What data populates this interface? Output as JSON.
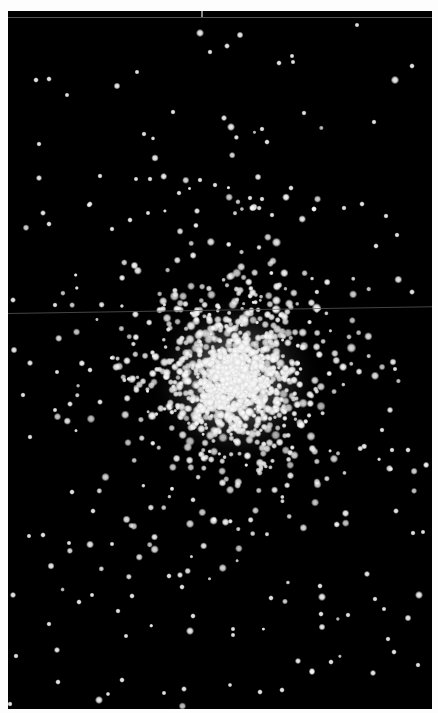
{
  "image": {
    "subject": "globular star cluster",
    "width": 438,
    "height": 713,
    "border_color": "#fdfdfd",
    "background_color": "#000000",
    "frame": {
      "left": 8,
      "top": 11,
      "width": 424,
      "height": 698
    }
  },
  "artifacts": {
    "top_seam": {
      "y": 17,
      "color": "#7a7a7a"
    },
    "mid_seam": {
      "y_left": 315,
      "y_right": 307,
      "color": "#5a5a5a"
    },
    "top_tick": {
      "x": 201,
      "y": 11
    }
  },
  "cluster": {
    "center": [
      235,
      380
    ],
    "core_radius": 55,
    "halo_radius": 190,
    "core_glow_color": "#ffffff",
    "star_color": "#f2f2f2",
    "core_star_count": 900,
    "halo_star_count": 650,
    "seed": 1337
  },
  "field_stars": [
    [
      200,
      33,
      2.6
    ],
    [
      240,
      35,
      2.2
    ],
    [
      227,
      46,
      1.9
    ],
    [
      210,
      52,
      1.7
    ],
    [
      357,
      25,
      1.6
    ],
    [
      49,
      79,
      1.8
    ],
    [
      36,
      80,
      1.8
    ],
    [
      117,
      86,
      2.2
    ],
    [
      137,
      72,
      1.6
    ],
    [
      279,
      63,
      1.8
    ],
    [
      292,
      56,
      1.6
    ],
    [
      293,
      62,
      1.6
    ],
    [
      395,
      80,
      2.7
    ],
    [
      412,
      66,
      1.8
    ],
    [
      67,
      95,
      1.6
    ],
    [
      173,
      112,
      1.7
    ],
    [
      231,
      127,
      2.6
    ],
    [
      224,
      118,
      2.0
    ],
    [
      262,
      129,
      1.7
    ],
    [
      267,
      142,
      1.8
    ],
    [
      304,
      113,
      1.7
    ],
    [
      39,
      144,
      1.7
    ],
    [
      144,
      134,
      1.7
    ],
    [
      155,
      158,
      2.4
    ],
    [
      374,
      122,
      1.7
    ],
    [
      39,
      178,
      2.0
    ],
    [
      100,
      176,
      1.7
    ],
    [
      136,
      179,
      1.6
    ],
    [
      150,
      179,
      1.7
    ],
    [
      200,
      180,
      1.7
    ],
    [
      215,
      185,
      1.7
    ],
    [
      258,
      177,
      2.2
    ],
    [
      291,
      188,
      1.8
    ],
    [
      179,
      193,
      1.7
    ],
    [
      90,
      204,
      1.8
    ],
    [
      250,
      198,
      1.7
    ],
    [
      262,
      199,
      1.7
    ],
    [
      253,
      208,
      2.2
    ],
    [
      314,
      209,
      1.8
    ],
    [
      344,
      208,
      1.7
    ],
    [
      362,
      204,
      1.8
    ],
    [
      43,
      213,
      1.9
    ],
    [
      49,
      224,
      1.8
    ],
    [
      89,
      205,
      1.7
    ],
    [
      148,
      213,
      1.6
    ],
    [
      197,
      211,
      2.0
    ],
    [
      252,
      208,
      2.0
    ],
    [
      272,
      215,
      1.7
    ],
    [
      314,
      209,
      1.8
    ],
    [
      386,
      216,
      1.7
    ],
    [
      130,
      220,
      1.8
    ],
    [
      112,
      229,
      1.7
    ],
    [
      397,
      235,
      1.7
    ],
    [
      376,
      246,
      1.8
    ],
    [
      13,
      300,
      1.9
    ],
    [
      55,
      305,
      1.7
    ],
    [
      412,
      292,
      1.9
    ],
    [
      14,
      350,
      2.2
    ],
    [
      30,
      363,
      2.0
    ],
    [
      90,
      370,
      1.8
    ],
    [
      57,
      372,
      1.6
    ],
    [
      393,
      362,
      2.3
    ],
    [
      395,
      369,
      1.6
    ],
    [
      23,
      395,
      1.7
    ],
    [
      70,
      404,
      1.9
    ],
    [
      55,
      410,
      1.6
    ],
    [
      100,
      402,
      1.9
    ],
    [
      390,
      410,
      2.1
    ],
    [
      382,
      430,
      1.7
    ],
    [
      408,
      450,
      1.8
    ],
    [
      392,
      450,
      1.7
    ],
    [
      30,
      437,
      1.7
    ],
    [
      72,
      492,
      1.8
    ],
    [
      93,
      511,
      1.8
    ],
    [
      43,
      535,
      1.8
    ],
    [
      29,
      536,
      1.6
    ],
    [
      69,
      543,
      1.6
    ],
    [
      413,
      533,
      1.7
    ],
    [
      396,
      511,
      1.9
    ],
    [
      423,
      532,
      1.6
    ],
    [
      51,
      566,
      2.3
    ],
    [
      112,
      544,
      1.6
    ],
    [
      13,
      595,
      2.0
    ],
    [
      79,
      602,
      1.8
    ],
    [
      92,
      595,
      1.6
    ],
    [
      118,
      611,
      1.7
    ],
    [
      132,
      596,
      1.8
    ],
    [
      182,
      587,
      1.8
    ],
    [
      193,
      616,
      1.8
    ],
    [
      190,
      631,
      2.6
    ],
    [
      169,
      576,
      1.8
    ],
    [
      180,
      575,
      2.0
    ],
    [
      233,
      629,
      1.6
    ],
    [
      233,
      635,
      1.6
    ],
    [
      271,
      598,
      1.8
    ],
    [
      320,
      586,
      1.8
    ],
    [
      322,
      597,
      2.6
    ],
    [
      321,
      614,
      1.8
    ],
    [
      322,
      627,
      2.2
    ],
    [
      348,
      615,
      1.7
    ],
    [
      367,
      574,
      2.0
    ],
    [
      375,
      599,
      1.7
    ],
    [
      384,
      609,
      1.6
    ],
    [
      408,
      618,
      2.2
    ],
    [
      419,
      595,
      2.6
    ],
    [
      388,
      639,
      1.7
    ],
    [
      394,
      652,
      1.8
    ],
    [
      49,
      624,
      1.7
    ],
    [
      57,
      650,
      2.0
    ],
    [
      16,
      656,
      1.7
    ],
    [
      126,
      636,
      1.6
    ],
    [
      298,
      661,
      2.0
    ],
    [
      312,
      671,
      2.0
    ],
    [
      331,
      662,
      1.8
    ],
    [
      373,
      673,
      2.0
    ],
    [
      418,
      665,
      1.7
    ],
    [
      58,
      682,
      1.8
    ],
    [
      122,
      680,
      1.8
    ],
    [
      99,
      700,
      2.6
    ],
    [
      108,
      694,
      1.5
    ],
    [
      164,
      693,
      1.6
    ],
    [
      184,
      689,
      1.9
    ],
    [
      230,
      685,
      1.5
    ],
    [
      260,
      692,
      1.8
    ],
    [
      282,
      690,
      1.8
    ],
    [
      312,
      672,
      2.0
    ],
    [
      10,
      704,
      1.7
    ]
  ]
}
